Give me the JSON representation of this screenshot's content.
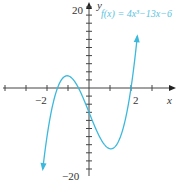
{
  "chart_data": {
    "type": "line",
    "title": "",
    "function_label": "f(x) = 4x³−13x−6",
    "xlabel": "x",
    "ylabel": "y",
    "xlim": [
      -4,
      3
    ],
    "ylim": [
      -20,
      20
    ],
    "x_tick_labels": [
      "-2",
      "2"
    ],
    "y_tick_labels": [
      "20",
      "-20"
    ],
    "x_tick_step": 1,
    "y_tick_step": 2,
    "grid": false,
    "curve_color": "#3bb8dc",
    "series": [
      {
        "name": "f(x) = 4x^3 - 13x - 6",
        "x": [
          -2.2,
          -2,
          -1.5,
          -1.04,
          -0.5,
          0,
          0.5,
          1.04,
          1.5,
          2,
          2.3
        ],
        "y": [
          -19.99,
          -12,
          0,
          3.0,
          0,
          -6,
          -12,
          -15.0,
          -12,
          0,
          13.77
        ]
      }
    ],
    "annotations": [
      "f(x) = 4x³−13x−6"
    ]
  },
  "labels": {
    "y20": "20",
    "yneg20": "−20",
    "xneg2": "−2",
    "x2": "2",
    "xaxis": "x",
    "yaxis": "y",
    "func": "f(x) = 4x³−13x−6"
  }
}
